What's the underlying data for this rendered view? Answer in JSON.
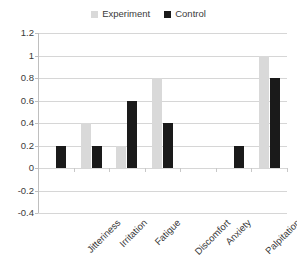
{
  "chart_data": {
    "type": "bar",
    "title": "",
    "subtitle": "",
    "xlabel": "",
    "ylabel": "",
    "categories": [
      "Jitteriness",
      "Irritation",
      "Fatigue",
      "Discomfort",
      "Anxiety",
      "Palpitation",
      "Bad odor"
    ],
    "series": [
      {
        "name": "Experiment",
        "color": "#d9d9d9",
        "values": [
          0,
          0.4,
          0.2,
          0.8,
          0,
          0,
          1.0
        ]
      },
      {
        "name": "Control",
        "color": "#1a1a1a",
        "values": [
          0.2,
          0.2,
          0.6,
          0.4,
          0,
          0.2,
          0.8
        ]
      }
    ],
    "ylim": [
      -0.4,
      1.2
    ],
    "ytick_step": 0.2,
    "yticks": [
      "1.2",
      "1",
      "0.8",
      "0.6",
      "0.4",
      "0.2",
      "0",
      "-0.2",
      "-0.4"
    ],
    "ytick_values": [
      1.2,
      1,
      0.8,
      0.6,
      0.4,
      0.2,
      0,
      -0.2,
      -0.4
    ],
    "grid": true,
    "grid_axis": "y",
    "legend_position": "top-center",
    "legend": [
      {
        "label": "Experiment",
        "color": "#d9d9d9"
      },
      {
        "label": "Control",
        "color": "#1a1a1a"
      }
    ],
    "x_tick_label_rotation": -45,
    "background": "#ffffff",
    "gridline_color": "#d6d6d6",
    "axis_color": "#bfbfbf",
    "text_color": "#3a3a3a"
  }
}
